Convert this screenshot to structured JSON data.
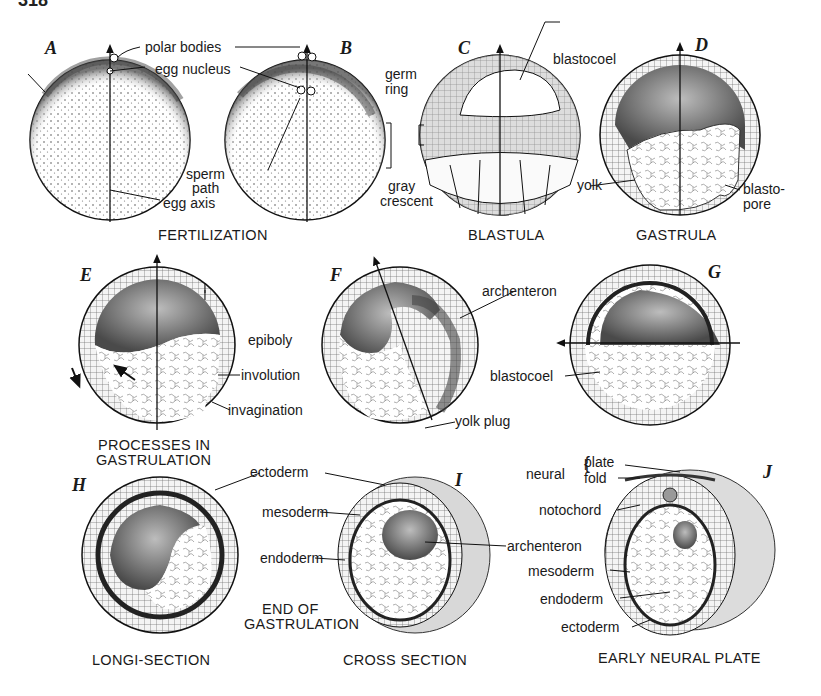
{
  "page": {
    "number_fragment": "318"
  },
  "panels": {
    "A": {
      "letter": "A"
    },
    "B": {
      "letter": "B"
    },
    "C": {
      "letter": "C"
    },
    "D": {
      "letter": "D"
    },
    "E": {
      "letter": "E"
    },
    "F": {
      "letter": "F"
    },
    "G": {
      "letter": "G"
    },
    "H": {
      "letter": "H"
    },
    "I": {
      "letter": "I"
    },
    "J": {
      "letter": "J"
    }
  },
  "labels": {
    "polar_bodies": "polar bodies",
    "egg_nucleus": "egg nucleus",
    "sperm": "sperm",
    "path": "path",
    "egg_axis": "egg axis",
    "germ": "germ",
    "ring": "ring",
    "gray": "gray",
    "crescent": "crescent",
    "blastocoel_c": "blastocoel",
    "yolk": "yolk",
    "blasto": "blasto-",
    "pore": "pore",
    "epiboly": "epiboly",
    "involution": "involution",
    "invagination": "invagination",
    "archenteron_f": "archenteron",
    "yolk_plug": "yolk plug",
    "blastocoel_g": "blastocoel",
    "ectoderm_h": "ectoderm",
    "mesoderm_h": "mesoderm",
    "endoderm_h": "endoderm",
    "archenteron_i": "archenteron",
    "neural": "neural",
    "plate": "plate",
    "fold": "fold",
    "notochord": "notochord",
    "mesoderm_j": "mesoderm",
    "endoderm_j": "endoderm",
    "ectoderm_j": "ectoderm"
  },
  "captions": {
    "fertilization": "FERTILIZATION",
    "blastula": "BLASTULA",
    "gastrula": "GASTRULA",
    "processes_1": "PROCESSES IN",
    "processes_2": "GASTRULATION",
    "end_of_1": "END OF",
    "end_of_2": "GASTRULATION",
    "longi_section": "LONGI-SECTION",
    "cross_section": "CROSS SECTION",
    "early_neural_plate": "EARLY NEURAL PLATE"
  }
}
